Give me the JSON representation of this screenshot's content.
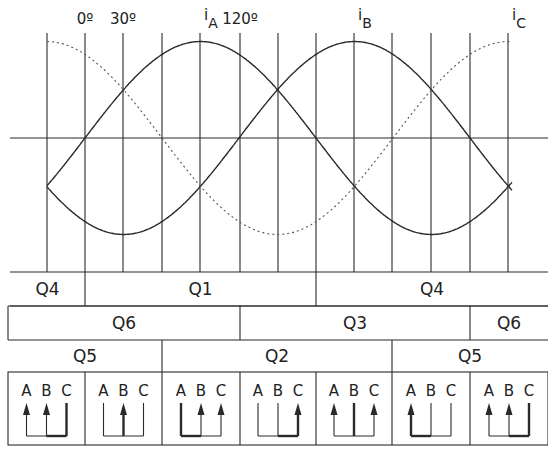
{
  "angle_labels": [
    {
      "text": "0º",
      "x": 85
    },
    {
      "text": "30º",
      "x": 123
    },
    {
      "text": "120º",
      "x": 240
    }
  ],
  "phase_labels": [
    {
      "name": "i",
      "sub": "A",
      "x": 200
    },
    {
      "name": "i",
      "sub": "B",
      "x": 354
    },
    {
      "name": "i",
      "sub": "C",
      "x": 508
    }
  ],
  "waveforms": {
    "axis_y": 138,
    "amplitude_px": 96.5,
    "x_zero_deg": 85,
    "px_per_deg": 1.2833,
    "x_start": 47,
    "x_end": 512,
    "phases": [
      {
        "name": "iA",
        "phase_deg": 0,
        "style": "solid"
      },
      {
        "name": "iB",
        "phase_deg": 120,
        "style": "solid"
      },
      {
        "name": "iC",
        "phase_deg": 240,
        "style": "dotted"
      }
    ]
  },
  "gridlines_x": [
    47,
    85,
    123,
    162,
    200,
    240,
    278,
    316,
    354,
    392,
    431,
    470,
    508
  ],
  "switch_rows": [
    {
      "row": "upper-A-row",
      "segments": [
        {
          "label": "Q4",
          "x0": 10,
          "x1": 85
        },
        {
          "label": "Q1",
          "x0": 85,
          "x1": 316
        },
        {
          "label": "Q4",
          "x0": 316,
          "x1": 548
        }
      ]
    },
    {
      "row": "middle-row",
      "segments": [
        {
          "label": "Q6",
          "x0": 8,
          "x1": 240
        },
        {
          "label": "Q3",
          "x0": 240,
          "x1": 470
        },
        {
          "label": "Q6",
          "x0": 470,
          "x1": 548
        }
      ]
    },
    {
      "row": "lower-row",
      "segments": [
        {
          "label": "Q5",
          "x0": 8,
          "x1": 162
        },
        {
          "label": "Q2",
          "x0": 162,
          "x1": 392
        },
        {
          "label": "Q5",
          "x0": 392,
          "x1": 548
        }
      ]
    }
  ],
  "current_flow_boxes": [
    {
      "x0": 8,
      "x1": 85,
      "labels": [
        "A",
        "B",
        "C"
      ],
      "arrows": [
        "A",
        "B"
      ],
      "bold": [
        "C"
      ]
    },
    {
      "x0": 85,
      "x1": 162,
      "labels": [
        "A",
        "B",
        "C"
      ],
      "arrows": [
        "B"
      ],
      "bold": [
        "B"
      ]
    },
    {
      "x0": 162,
      "x1": 240,
      "labels": [
        "A",
        "B",
        "C"
      ],
      "arrows": [
        "B",
        "C"
      ],
      "bold": [
        "A"
      ]
    },
    {
      "x0": 240,
      "x1": 316,
      "labels": [
        "A",
        "B",
        "C"
      ],
      "arrows": [
        "C"
      ],
      "bold": [
        "C"
      ]
    },
    {
      "x0": 316,
      "x1": 392,
      "labels": [
        "A",
        "B",
        "C"
      ],
      "arrows": [
        "A",
        "C"
      ],
      "bold": [
        "B"
      ]
    },
    {
      "x0": 392,
      "x1": 470,
      "labels": [
        "A",
        "B",
        "C"
      ],
      "arrows": [
        "A"
      ],
      "bold": [
        "A"
      ]
    },
    {
      "x0": 470,
      "x1": 548,
      "labels": [
        "A",
        "B",
        "C"
      ],
      "arrows": [
        "A",
        "B"
      ],
      "bold": [
        "C"
      ]
    }
  ],
  "colors": {
    "line": "#2a2a2a",
    "dotted": "#555555",
    "bg": "#ffffff"
  }
}
